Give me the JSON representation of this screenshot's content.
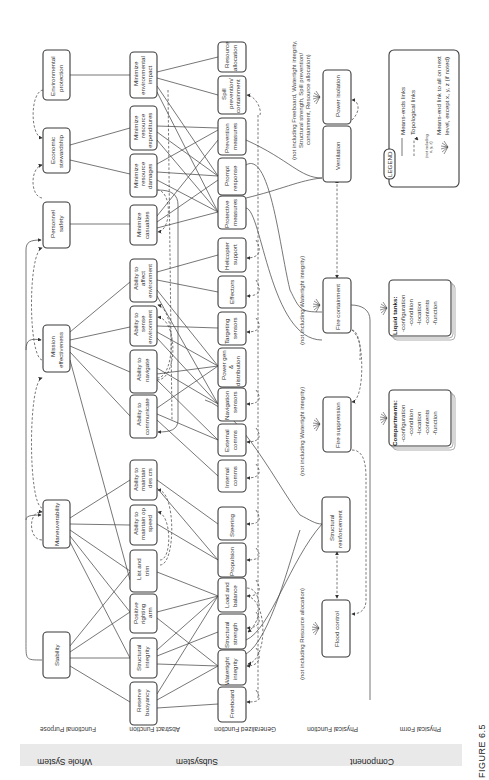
{
  "figure": {
    "caption": "FIGURE 6.5"
  },
  "groups": {
    "whole_system": "Whole System",
    "subsystem": "Subsystem",
    "component": "Component"
  },
  "levels": {
    "functional_purpose": "Functional Purpose",
    "abstract_function": "Abstract Function",
    "generalized_function": "Generalized Function",
    "physical_function": "Physical Function",
    "physical_form": "Physical Form"
  },
  "functional_purpose": {
    "environmental_protection": [
      "Environmental",
      "protection"
    ],
    "economic_stewardship": [
      "Economic",
      "stewardship"
    ],
    "personnel_safety": [
      "Personnel",
      "safety"
    ],
    "mission_effectiveness": [
      "Mission",
      "effectiveness"
    ],
    "maneuverability": [
      "Maneuverability"
    ],
    "stability": [
      "Stability"
    ]
  },
  "abstract_function": {
    "min_env_impact": [
      "Minimize",
      "environmental",
      "impact"
    ],
    "min_resource_expenditures": [
      "Minimize",
      "resource",
      "expenditures"
    ],
    "min_resource_damages": [
      "Minimize",
      "resource",
      "damages"
    ],
    "min_casualties": [
      "Minimize",
      "casualties"
    ],
    "ability_affect_env": [
      "Ability to",
      "affect",
      "environment"
    ],
    "ability_sense_env": [
      "Ability to",
      "sense",
      "environment"
    ],
    "ability_navigate": [
      "Ability to",
      "navigate"
    ],
    "ability_communicate": [
      "Ability to",
      "communicate"
    ],
    "ability_maintain_des_crs": [
      "Ability to",
      "maintain",
      "des crs"
    ],
    "ability_maintain_op_speed": [
      "Ability to",
      "maintain op",
      "speed"
    ],
    "list_and_trim": [
      "List and",
      "trim"
    ],
    "positive_righting_arm": [
      "Positive",
      "righting",
      "arm"
    ],
    "structural_integrity": [
      "Structural",
      "integrity"
    ],
    "reserve_buoyancy": [
      "Reserve",
      "buoyancy"
    ]
  },
  "generalized_function": {
    "resource_allocation": [
      "Resource",
      "allocation"
    ],
    "spill_prevention": [
      "Spill",
      "prevention/",
      "containment"
    ],
    "prevention_measures": [
      "Prevention",
      "measures"
    ],
    "prompt_response": [
      "Prompt",
      "response"
    ],
    "protective_measures": [
      "Protective",
      "measures"
    ],
    "helicopter_support": [
      "Helicopter",
      "support"
    ],
    "effectors": [
      "Effectors"
    ],
    "targeting_sensors": [
      "Targeting",
      "sensors"
    ],
    "power_gen": [
      "Power gen",
      "&",
      "distribution"
    ],
    "navigation_sensors": [
      "Navigation",
      "sensors"
    ],
    "external_comms": [
      "External",
      "comms"
    ],
    "internal_comms": [
      "Internal",
      "comms"
    ],
    "steering": [
      "Steering"
    ],
    "propulsion": [
      "Propulsion"
    ],
    "load_and_balance": [
      "Load and",
      "balance"
    ],
    "structural_strength": [
      "Structural",
      "strength"
    ],
    "watertight_integrity": [
      "Watertight",
      "integrity"
    ],
    "freeboard": [
      "Freeboard"
    ]
  },
  "physical_function": {
    "power_isolation": [
      "Power isolation"
    ],
    "ventilation": [
      "Ventilation"
    ],
    "fire_containment": [
      "Fire containment"
    ],
    "fire_suppression": [
      "Fire suppression"
    ],
    "structural_reinforcement": [
      "Structural",
      "reinforcement"
    ],
    "flood_control": [
      "Flood control"
    ]
  },
  "physical_form": {
    "liquid_tanks": {
      "title": "Liquid tanks:",
      "items": [
        "-configuration",
        "-condition",
        "-location",
        "-contents",
        "-function"
      ]
    },
    "compartments": {
      "title": "Compartments:",
      "items": [
        "-configuration",
        "-condition",
        "-location",
        "-contents",
        "-function"
      ]
    }
  },
  "annotations": {
    "power_isolation_note": [
      "(not including Freeboard, Watertight integrity,",
      "Structural strength, Spill prevention/",
      "containment, Resource allocation)"
    ],
    "fire_containment_note": "(not including Watertight integrity)",
    "fire_suppression_note": "(not including Watertight integrity)",
    "flood_control_note": "(not including Resource allocation)"
  },
  "legend": {
    "title": "LEGEND",
    "means_ends": "Means-ends links",
    "topological": "Topological links",
    "not_including": [
      "(not including",
      "x, y, z)"
    ],
    "burst_desc": [
      "Means-end link to all on next",
      "level, except x, y, z (if noted)"
    ]
  }
}
